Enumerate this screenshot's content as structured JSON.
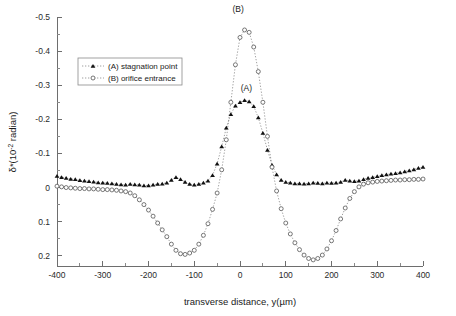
{
  "chart_data": {
    "type": "scatter",
    "title": "",
    "xlabel": "transverse distance, y(µm)",
    "ylabel": "δ*(10⁻² radian)",
    "xlim": [
      -400,
      400
    ],
    "ylim": [
      -0.5,
      0.23
    ],
    "y_axis_inverted": true,
    "grid": false,
    "legend_position": "upper-left-inside",
    "xticks": [
      -400,
      -300,
      -200,
      -100,
      0,
      100,
      200,
      300,
      400
    ],
    "xtick_labels": [
      "-400",
      "-300",
      "-200",
      "-100",
      "0",
      "100",
      "200",
      "300",
      "400"
    ],
    "yticks": [
      -0.5,
      -0.4,
      -0.3,
      -0.2,
      -0.1,
      0,
      0.1,
      0.2
    ],
    "ytick_labels": [
      "-0.5",
      "-0.4",
      "-0.3",
      "-0.2",
      "-0.1",
      "0",
      "0.1",
      "0.2"
    ],
    "x_minor_ticks_between": 1,
    "y_minor_ticks_between": 1,
    "annotations": [
      {
        "text": "(A)",
        "x": 14,
        "y": -0.284
      },
      {
        "text": "(B)",
        "x": -4,
        "y": -0.515
      }
    ],
    "series": [
      {
        "name": "(A) stagnation point",
        "label": "(A) stagnation point",
        "marker": "filled-triangle",
        "line_style": "dotted",
        "color": "#111111",
        "x": [
          -400,
          -390,
          -380,
          -370,
          -360,
          -350,
          -340,
          -330,
          -320,
          -310,
          -300,
          -290,
          -280,
          -270,
          -260,
          -250,
          -240,
          -230,
          -220,
          -210,
          -200,
          -190,
          -180,
          -170,
          -160,
          -150,
          -140,
          -130,
          -120,
          -110,
          -100,
          -90,
          -80,
          -70,
          -60,
          -50,
          -40,
          -30,
          -20,
          -10,
          0,
          10,
          20,
          30,
          40,
          50,
          60,
          70,
          80,
          90,
          100,
          110,
          120,
          130,
          140,
          150,
          160,
          170,
          180,
          190,
          200,
          210,
          220,
          230,
          240,
          250,
          260,
          270,
          280,
          290,
          300,
          310,
          320,
          330,
          340,
          350,
          360,
          370,
          380,
          390,
          400
        ],
        "y": [
          -0.034,
          -0.03,
          -0.028,
          -0.025,
          -0.024,
          -0.021,
          -0.02,
          -0.018,
          -0.017,
          -0.015,
          -0.014,
          -0.013,
          -0.012,
          -0.01,
          -0.009,
          -0.008,
          -0.01,
          -0.009,
          -0.008,
          -0.006,
          -0.006,
          -0.008,
          -0.01,
          -0.011,
          -0.014,
          -0.022,
          -0.03,
          -0.024,
          -0.016,
          -0.01,
          -0.008,
          -0.01,
          -0.014,
          -0.02,
          -0.036,
          -0.07,
          -0.12,
          -0.175,
          -0.215,
          -0.24,
          -0.25,
          -0.256,
          -0.252,
          -0.238,
          -0.205,
          -0.16,
          -0.11,
          -0.066,
          -0.038,
          -0.022,
          -0.016,
          -0.014,
          -0.012,
          -0.012,
          -0.011,
          -0.012,
          -0.014,
          -0.013,
          -0.012,
          -0.014,
          -0.013,
          -0.014,
          -0.016,
          -0.022,
          -0.02,
          -0.018,
          -0.02,
          -0.024,
          -0.028,
          -0.03,
          -0.033,
          -0.036,
          -0.038,
          -0.04,
          -0.042,
          -0.044,
          -0.047,
          -0.05,
          -0.053,
          -0.057,
          -0.06
        ]
      },
      {
        "name": "(B) orifice entrance",
        "label": "(B) orifice entrance",
        "marker": "open-circle",
        "line_style": "dotted",
        "color": "#555555",
        "x": [
          -400,
          -390,
          -380,
          -370,
          -360,
          -350,
          -340,
          -330,
          -320,
          -310,
          -300,
          -290,
          -280,
          -270,
          -260,
          -250,
          -240,
          -230,
          -220,
          -210,
          -200,
          -190,
          -180,
          -170,
          -160,
          -150,
          -140,
          -130,
          -120,
          -110,
          -100,
          -90,
          -80,
          -70,
          -60,
          -50,
          -40,
          -30,
          -20,
          -10,
          0,
          10,
          20,
          30,
          40,
          50,
          60,
          70,
          80,
          90,
          100,
          110,
          120,
          130,
          140,
          150,
          160,
          170,
          180,
          190,
          200,
          210,
          220,
          230,
          240,
          250,
          260,
          270,
          280,
          290,
          300,
          310,
          320,
          330,
          340,
          350,
          360,
          370,
          380,
          390,
          400
        ],
        "y": [
          -0.004,
          -0.002,
          0.0,
          0.001,
          0.002,
          0.003,
          0.003,
          0.004,
          0.004,
          0.005,
          0.006,
          0.006,
          0.007,
          0.008,
          0.01,
          0.012,
          0.016,
          0.024,
          0.036,
          0.05,
          0.066,
          0.084,
          0.104,
          0.124,
          0.144,
          0.166,
          0.184,
          0.194,
          0.196,
          0.192,
          0.184,
          0.166,
          0.14,
          0.106,
          0.064,
          0.016,
          -0.052,
          -0.14,
          -0.25,
          -0.36,
          -0.44,
          -0.462,
          -0.455,
          -0.412,
          -0.34,
          -0.25,
          -0.15,
          -0.06,
          0.01,
          0.062,
          0.104,
          0.136,
          0.162,
          0.182,
          0.198,
          0.208,
          0.212,
          0.208,
          0.198,
          0.18,
          0.156,
          0.126,
          0.092,
          0.06,
          0.032,
          0.012,
          -0.002,
          -0.01,
          -0.014,
          -0.016,
          -0.018,
          -0.019,
          -0.02,
          -0.021,
          -0.022,
          -0.022,
          -0.023,
          -0.023,
          -0.024,
          -0.024,
          -0.025
        ]
      }
    ]
  },
  "legend": {
    "entries": [
      {
        "label": "(A) stagnation point",
        "marker": "filled-triangle"
      },
      {
        "label": "(B) orifice entrance",
        "marker": "open-circle"
      }
    ]
  }
}
